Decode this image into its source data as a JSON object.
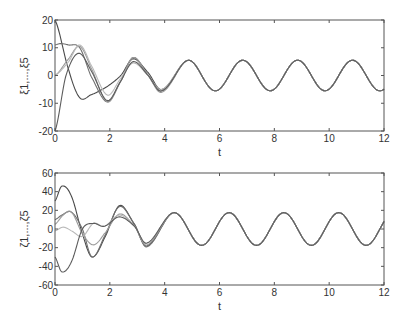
{
  "chart_data": [
    {
      "type": "line",
      "title": "",
      "xlabel": "t",
      "ylabel": "ξ1,...,ξ5",
      "xlim": [
        0,
        12
      ],
      "ylim": [
        -20,
        20
      ],
      "xticks": [
        0,
        2,
        4,
        6,
        8,
        10,
        12
      ],
      "yticks": [
        -20,
        -10,
        0,
        10,
        20
      ],
      "grid": false,
      "legend": null,
      "steady_state": {
        "amplitude": 5.5,
        "period": 2,
        "first_peak_t": 0.85
      },
      "series": [
        {
          "name": "ξ1",
          "x": [
            0,
            0.5,
            0.9,
            1.3,
            1.9,
            2.4,
            2.85,
            3.4,
            3.9,
            4.9,
            5.9,
            6.85
          ],
          "values": [
            20,
            2,
            -8,
            -7,
            -4,
            0,
            6,
            1,
            -5,
            5.5,
            -5.5,
            5.5
          ]
        },
        {
          "name": "ξ2",
          "x": [
            0,
            0.2,
            0.5,
            0.9,
            1.3,
            1.9,
            2.4,
            2.85,
            3.4,
            3.9,
            4.9,
            5.9,
            6.85
          ],
          "values": [
            11,
            11.5,
            11,
            10,
            0,
            -9.5,
            -2,
            6.5,
            0,
            -5.5,
            5.5,
            -5.5,
            5.5
          ]
        },
        {
          "name": "ξ3",
          "x": [
            0,
            0.5,
            0.9,
            1.3,
            1.9,
            2.4,
            2.85,
            3.4,
            3.9,
            4.9,
            5.9,
            6.85
          ],
          "values": [
            0,
            6,
            10.5,
            3,
            -9.5,
            -2,
            6.5,
            0,
            -6,
            5.5,
            -5.5,
            5.5
          ]
        },
        {
          "name": "ξ4",
          "x": [
            0,
            0.5,
            0.9,
            1.3,
            1.9,
            2.4,
            2.85,
            3.4,
            3.9,
            4.9,
            5.9,
            6.85
          ],
          "values": [
            0,
            5,
            11,
            4,
            -7,
            -1,
            4.5,
            0,
            -5,
            5.5,
            -5.5,
            5.5
          ]
        },
        {
          "name": "ξ5",
          "x": [
            0,
            0.4,
            0.85,
            1.3,
            1.9,
            2.4,
            2.85,
            3.4,
            3.9,
            4.9,
            5.9,
            6.85
          ],
          "values": [
            -20,
            0,
            8,
            2,
            -9,
            -2,
            5,
            0,
            -5.5,
            5.5,
            -5.5,
            5.5
          ]
        }
      ]
    },
    {
      "type": "line",
      "title": "",
      "xlabel": "t",
      "ylabel": "ζ1,...,ζ5",
      "xlim": [
        0,
        12
      ],
      "ylim": [
        -60,
        60
      ],
      "xticks": [
        0,
        2,
        4,
        6,
        8,
        10,
        12
      ],
      "yticks": [
        -60,
        -40,
        -20,
        0,
        20,
        40,
        60
      ],
      "grid": false,
      "legend": null,
      "steady_state": {
        "amplitude": 17.5,
        "period": 2,
        "first_peak_t": 0.35
      },
      "series": [
        {
          "name": "ζ1",
          "x": [
            0,
            0.25,
            0.6,
            1.0,
            1.35,
            1.8,
            2.35,
            2.9,
            3.35,
            4.35,
            5.35,
            6.35
          ],
          "values": [
            30,
            46,
            35,
            -5,
            -30,
            -10,
            25,
            5,
            -18,
            17.5,
            -17.5,
            17.5
          ]
        },
        {
          "name": "ζ2",
          "x": [
            0,
            0.25,
            0.6,
            1.0,
            1.35,
            1.8,
            2.35,
            2.9,
            3.35,
            4.35,
            5.35,
            6.35
          ],
          "values": [
            10,
            15,
            18,
            0,
            -30,
            -8,
            24,
            5,
            -19,
            17.5,
            -17.5,
            17.5
          ]
        },
        {
          "name": "ζ3",
          "x": [
            0,
            0.3,
            0.6,
            1.0,
            1.4,
            1.8,
            2.35,
            2.9,
            3.35,
            4.35,
            5.35,
            6.35
          ],
          "values": [
            5,
            15,
            18,
            -5,
            -17,
            -5,
            16,
            3,
            -17,
            17.5,
            -17.5,
            17.5
          ]
        },
        {
          "name": "ζ4",
          "x": [
            0,
            0.3,
            0.6,
            1.0,
            1.4,
            1.8,
            2.35,
            2.9,
            3.35,
            4.35,
            5.35,
            6.35
          ],
          "values": [
            -2,
            2,
            -2,
            -8,
            6,
            3,
            15,
            3,
            -15,
            17.5,
            -17.5,
            17.5
          ]
        },
        {
          "name": "ζ5",
          "x": [
            0,
            0.25,
            0.6,
            1.0,
            1.4,
            1.8,
            2.35,
            2.9,
            3.35,
            4.35,
            5.35,
            6.35
          ],
          "values": [
            -30,
            -46,
            -35,
            0,
            6,
            3,
            13,
            3,
            -15,
            17.5,
            -17.5,
            17.5
          ]
        }
      ]
    }
  ]
}
